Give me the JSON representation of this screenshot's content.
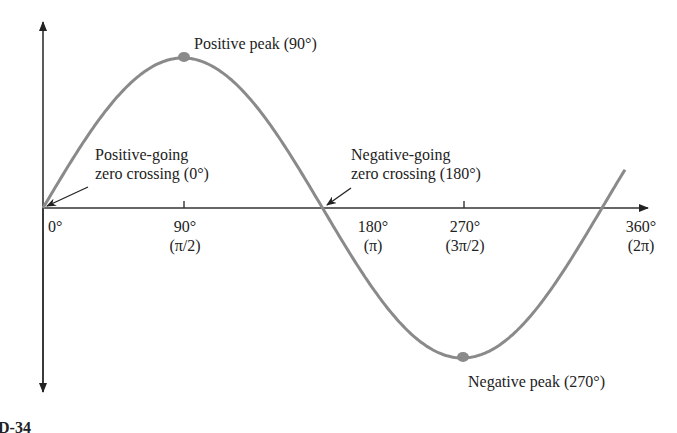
{
  "chart_data": {
    "type": "line",
    "title": "",
    "xlabel": "",
    "ylabel": "",
    "function": "sine",
    "x": [
      0,
      90,
      180,
      270,
      360
    ],
    "y": [
      0,
      1,
      0,
      -1,
      0
    ],
    "ticks": [
      {
        "deg": "0°",
        "rad": ""
      },
      {
        "deg": "90°",
        "rad": "(π/2)"
      },
      {
        "deg": "180°",
        "rad": "(π)"
      },
      {
        "deg": "270°",
        "rad": "(3π/2)"
      },
      {
        "deg": "360°",
        "rad": "(2π)"
      }
    ],
    "annotations": {
      "positive_peak": "Positive peak (90°)",
      "negative_peak": "Negative peak (270°)",
      "pos_zero_line1": "Positive-going",
      "pos_zero_line2": "zero crossing (0°)",
      "neg_zero_line1": "Negative-going",
      "neg_zero_line2": "zero crossing (180°)"
    },
    "colors": {
      "curve": "#8a8a8a",
      "axis": "#222222",
      "marker": "#8a8a8a"
    }
  },
  "caption_fragment": "D-34"
}
